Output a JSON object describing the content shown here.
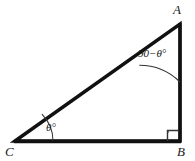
{
  "figure": {
    "type": "right-triangle-diagram",
    "background_color": "#ffffff",
    "stroke_color": "#111111",
    "arc_color": "#333333",
    "vertices": {
      "A": {
        "label": "A",
        "x": 180,
        "y": 24
      },
      "B": {
        "label": "B",
        "x": 180,
        "y": 141
      },
      "C": {
        "label": "C",
        "x": 15,
        "y": 141
      }
    },
    "angles": {
      "at_A": {
        "label": "90−θ°",
        "vertex": "A"
      },
      "at_B": {
        "label": "right-angle-marker",
        "vertex": "B",
        "measure": "90°"
      },
      "at_C": {
        "label": "θ°",
        "vertex": "C"
      }
    },
    "sides": [
      {
        "name": "hypotenuse-CA",
        "from": "C",
        "to": "A"
      },
      {
        "name": "leg-CB",
        "from": "C",
        "to": "B"
      },
      {
        "name": "leg-AB",
        "from": "A",
        "to": "B"
      }
    ]
  }
}
